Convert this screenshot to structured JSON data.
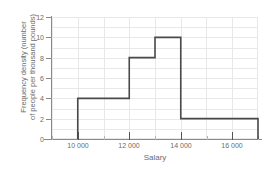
{
  "chart_data": {
    "type": "bar",
    "title": "",
    "subtitle": "",
    "xlabel": "Salary",
    "ylabel_line1": "Frequency density (number",
    "ylabel_line2": "of people per thousand pounds)",
    "ylabel": "Frequency density (number of people per thousand pounds)",
    "grid": true,
    "legend": "none",
    "xlim": [
      9000,
      17000
    ],
    "ylim": [
      0,
      12
    ],
    "x_tick_labels": [
      "10 000",
      "12 000",
      "14 000",
      "16 000"
    ],
    "x_tick_values": [
      10000,
      12000,
      14000,
      16000
    ],
    "x_minor_tick_values": [
      9000,
      11000,
      13000,
      15000,
      17000
    ],
    "y_tick_labels": [
      "0",
      "2",
      "4",
      "6",
      "8",
      "10",
      "12"
    ],
    "y_tick_values": [
      0,
      2,
      4,
      6,
      8,
      10,
      12
    ],
    "bins": [
      {
        "start": 10000,
        "end": 12000,
        "density": 4
      },
      {
        "start": 12000,
        "end": 13000,
        "density": 8
      },
      {
        "start": 13000,
        "end": 14000,
        "density": 10
      },
      {
        "start": 14000,
        "end": 17000,
        "density": 2
      }
    ],
    "categories": [
      "10000-12000",
      "12000-13000",
      "13000-14000",
      "14000-17000"
    ],
    "values": [
      4,
      8,
      10,
      2
    ],
    "colors": {
      "outline": "#4a4a4a",
      "grid": "#e8e8e8",
      "axis": "#8a8a8a",
      "text": "#6b6b6b",
      "background": "#ffffff"
    }
  }
}
